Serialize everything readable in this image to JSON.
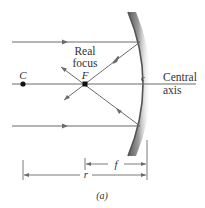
{
  "figure": {
    "labels": {
      "real_focus_line1": "Real",
      "real_focus_line2": "focus",
      "focal_point": "F",
      "center_of_curvature": "C",
      "vertex": "c",
      "axis_line1": "Central",
      "axis_line2": "axis",
      "focal_length": "f",
      "radius": "r",
      "caption": "(a)"
    },
    "colors": {
      "ray": "#6b6b6b",
      "mirror": "#8a8a8a",
      "point": "#111111",
      "text": "#333333"
    }
  }
}
